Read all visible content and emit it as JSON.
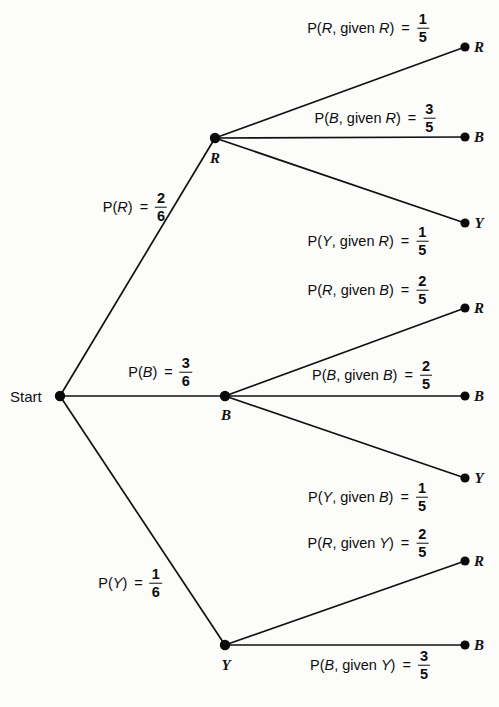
{
  "diagram": {
    "type": "probability-tree",
    "title": "",
    "start_label": "Start",
    "nodes": [
      {
        "id": "start",
        "label": "Start",
        "x": 60,
        "y": 396
      },
      {
        "id": "r1",
        "label": "R",
        "x": 215,
        "y": 138
      },
      {
        "id": "b1",
        "label": "B",
        "x": 225,
        "y": 396
      },
      {
        "id": "y1",
        "label": "Y",
        "x": 225,
        "y": 645
      },
      {
        "id": "r1r",
        "label": "R",
        "x": 465,
        "y": 47
      },
      {
        "id": "r1b",
        "label": "B",
        "x": 465,
        "y": 137
      },
      {
        "id": "r1y",
        "label": "Y",
        "x": 465,
        "y": 223
      },
      {
        "id": "b1r",
        "label": "R",
        "x": 465,
        "y": 308
      },
      {
        "id": "b1b",
        "label": "B",
        "x": 465,
        "y": 396
      },
      {
        "id": "b1y",
        "label": "Y",
        "x": 465,
        "y": 478
      },
      {
        "id": "y1r",
        "label": "R",
        "x": 465,
        "y": 561
      },
      {
        "id": "y1b",
        "label": "B",
        "x": 465,
        "y": 645
      }
    ],
    "edges": [
      {
        "from": "start",
        "to": "r1"
      },
      {
        "from": "start",
        "to": "b1"
      },
      {
        "from": "start",
        "to": "y1"
      },
      {
        "from": "r1",
        "to": "r1r"
      },
      {
        "from": "r1",
        "to": "r1b"
      },
      {
        "from": "r1",
        "to": "r1y"
      },
      {
        "from": "b1",
        "to": "b1r"
      },
      {
        "from": "b1",
        "to": "b1b"
      },
      {
        "from": "b1",
        "to": "b1y"
      },
      {
        "from": "y1",
        "to": "y1r"
      },
      {
        "from": "y1",
        "to": "y1b"
      }
    ],
    "edge_labels": [
      {
        "id": "lbl-pr",
        "pre": "P(",
        "var": "R",
        "mid": "",
        "cond": "",
        "post": ")",
        "numerator": "2",
        "denominator": "6",
        "x": 135,
        "y": 207
      },
      {
        "id": "lbl-pb",
        "pre": "P(",
        "var": "B",
        "mid": "",
        "cond": "",
        "post": ")",
        "numerator": "3",
        "denominator": "6",
        "x": 160,
        "y": 372
      },
      {
        "id": "lbl-py",
        "pre": "P(",
        "var": "Y",
        "mid": "",
        "cond": "",
        "post": ")",
        "numerator": "1",
        "denominator": "6",
        "x": 130,
        "y": 583
      },
      {
        "id": "lbl-prr",
        "pre": "P(",
        "var": "R",
        "mid": ", given ",
        "cond": "R",
        "post": ")",
        "numerator": "1",
        "denominator": "5",
        "x": 368,
        "y": 28
      },
      {
        "id": "lbl-pbr",
        "pre": "P(",
        "var": "B",
        "mid": ", given ",
        "cond": "R",
        "post": ")",
        "numerator": "3",
        "denominator": "5",
        "x": 375,
        "y": 118
      },
      {
        "id": "lbl-pyr",
        "pre": "P(",
        "var": "Y",
        "mid": ", given ",
        "cond": "R",
        "post": ")",
        "numerator": "1",
        "denominator": "5",
        "x": 368,
        "y": 241
      },
      {
        "id": "lbl-prb",
        "pre": "P(",
        "var": "R",
        "mid": ", given ",
        "cond": "B",
        "post": ")",
        "numerator": "2",
        "denominator": "5",
        "x": 368,
        "y": 290
      },
      {
        "id": "lbl-pbb",
        "pre": "P(",
        "var": "B",
        "mid": ", given ",
        "cond": "B",
        "post": ")",
        "numerator": "2",
        "denominator": "5",
        "x": 372,
        "y": 375
      },
      {
        "id": "lbl-pyb",
        "pre": "P(",
        "var": "Y",
        "mid": ", given ",
        "cond": "B",
        "post": ")",
        "numerator": "1",
        "denominator": "5",
        "x": 368,
        "y": 497
      },
      {
        "id": "lbl-pry",
        "pre": "P(",
        "var": "R",
        "mid": ", given ",
        "cond": "Y",
        "post": ")",
        "numerator": "2",
        "denominator": "5",
        "x": 368,
        "y": 543
      },
      {
        "id": "lbl-pby",
        "pre": "P(",
        "var": "B",
        "mid": ", given ",
        "cond": "Y",
        "post": ")",
        "numerator": "3",
        "denominator": "5",
        "x": 370,
        "y": 665
      }
    ],
    "node_text_labels": [
      {
        "id": "txt-r1",
        "text": "R",
        "x": 215,
        "y": 158
      },
      {
        "id": "txt-b1",
        "text": "B",
        "x": 226,
        "y": 415
      },
      {
        "id": "txt-y1",
        "text": "Y",
        "x": 226,
        "y": 665
      },
      {
        "id": "txt-r1r",
        "text": "R",
        "x": 479,
        "y": 47
      },
      {
        "id": "txt-r1b",
        "text": "B",
        "x": 479,
        "y": 137
      },
      {
        "id": "txt-r1y",
        "text": "Y",
        "x": 479,
        "y": 223
      },
      {
        "id": "txt-b1r",
        "text": "R",
        "x": 479,
        "y": 308
      },
      {
        "id": "txt-b1b",
        "text": "B",
        "x": 479,
        "y": 396
      },
      {
        "id": "txt-b1y",
        "text": "Y",
        "x": 479,
        "y": 478
      },
      {
        "id": "txt-y1r",
        "text": "R",
        "x": 479,
        "y": 561
      },
      {
        "id": "txt-y1b",
        "text": "B",
        "x": 479,
        "y": 645
      }
    ],
    "colors": {
      "line": "#111111",
      "node": "#0a0a0a",
      "text": "#111111",
      "background": "#fcfcfb"
    }
  },
  "chart_data": {
    "type": "tree",
    "root": "Start",
    "level1": [
      {
        "outcome": "R",
        "probability": "2/6",
        "value": 0.3333
      },
      {
        "outcome": "B",
        "probability": "3/6",
        "value": 0.5
      },
      {
        "outcome": "Y",
        "probability": "1/6",
        "value": 0.1667
      }
    ],
    "level2": [
      {
        "given": "R",
        "outcome": "R",
        "probability": "1/5",
        "value": 0.2
      },
      {
        "given": "R",
        "outcome": "B",
        "probability": "3/5",
        "value": 0.6
      },
      {
        "given": "R",
        "outcome": "Y",
        "probability": "1/5",
        "value": 0.2
      },
      {
        "given": "B",
        "outcome": "R",
        "probability": "2/5",
        "value": 0.4
      },
      {
        "given": "B",
        "outcome": "B",
        "probability": "2/5",
        "value": 0.4
      },
      {
        "given": "B",
        "outcome": "Y",
        "probability": "1/5",
        "value": 0.2
      },
      {
        "given": "Y",
        "outcome": "R",
        "probability": "2/5",
        "value": 0.4
      },
      {
        "given": "Y",
        "outcome": "B",
        "probability": "3/5",
        "value": 0.6
      }
    ]
  }
}
